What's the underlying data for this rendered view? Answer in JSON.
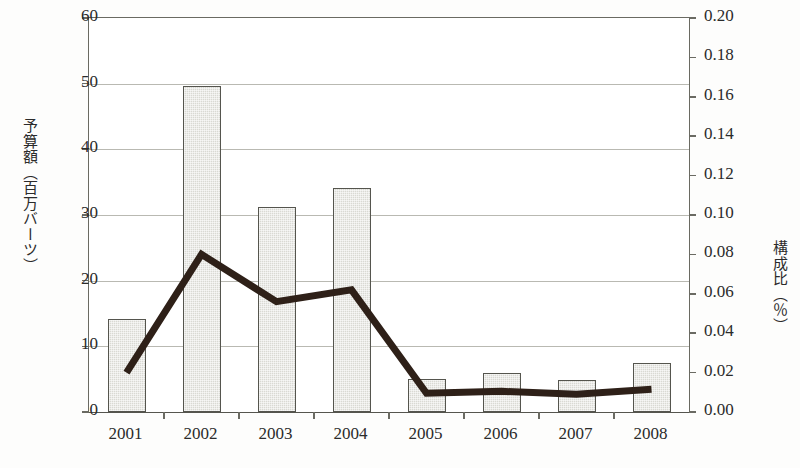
{
  "chart_data": {
    "type": "bar",
    "title": "",
    "subtitle": "",
    "xlabel": "",
    "categories": [
      "2001",
      "2002",
      "2003",
      "2004",
      "2005",
      "2006",
      "2007",
      "2008"
    ],
    "grid": true,
    "legend_position": "none",
    "axes": {
      "left": {
        "label": "予算額（百万バーツ）",
        "min": 0,
        "max": 60,
        "step": 10,
        "ticks": [
          "0",
          "10",
          "20",
          "30",
          "40",
          "50",
          "60"
        ]
      },
      "right": {
        "label": "構成比（％）",
        "min": 0.0,
        "max": 0.2,
        "step": 0.02,
        "ticks": [
          "0.00",
          "0.02",
          "0.04",
          "0.06",
          "0.08",
          "0.10",
          "0.12",
          "0.14",
          "0.16",
          "0.18",
          "0.20"
        ]
      }
    },
    "series": [
      {
        "name": "予算額（百万バーツ）",
        "type": "bar",
        "axis": "left",
        "color": "#d9d9d3",
        "border_color": "#55554e",
        "values": [
          14.2,
          49.6,
          31.2,
          34.1,
          5.0,
          5.9,
          4.9,
          7.5
        ]
      },
      {
        "name": "構成比（％）",
        "type": "line",
        "axis": "right",
        "color": "#2e2018",
        "values": [
          0.02,
          0.08,
          0.056,
          0.062,
          0.0095,
          0.0105,
          0.009,
          0.0115
        ]
      }
    ]
  },
  "colors": {
    "bar_fill": "#d9d9d3",
    "bar_border": "#55554e",
    "line": "#2e2018",
    "gridline": "#b9b9b2",
    "axis": "#6a6a62",
    "text": "#2b2b2b",
    "background": "#fdfdfc"
  }
}
